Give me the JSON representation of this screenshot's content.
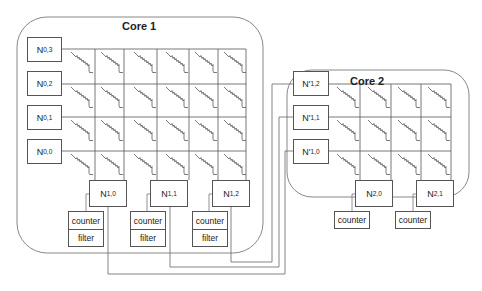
{
  "cores": [
    {
      "title": "Core 1",
      "row_nodes": [
        {
          "base": "N",
          "sub": "0,3"
        },
        {
          "base": "N",
          "sub": "0,2"
        },
        {
          "base": "N",
          "sub": "0,1"
        },
        {
          "base": "N",
          "sub": "0,0"
        }
      ],
      "column_nodes": [
        {
          "base": "N",
          "sub": "1,0",
          "modules": [
            "counter",
            "filter"
          ]
        },
        {
          "base": "N",
          "sub": "1,1",
          "modules": [
            "counter",
            "filter"
          ]
        },
        {
          "base": "N",
          "sub": "1,2",
          "modules": [
            "counter",
            "filter"
          ]
        }
      ],
      "grid": {
        "rows": 4,
        "cols": 6,
        "cell_element": "resistor-synapse"
      }
    },
    {
      "title": "Core 2",
      "row_nodes": [
        {
          "base": "N'",
          "sub": "1,2"
        },
        {
          "base": "N'",
          "sub": "1,1"
        },
        {
          "base": "N'",
          "sub": "1,0"
        }
      ],
      "column_nodes": [
        {
          "base": "N",
          "sub": "2,0",
          "modules": [
            "counter"
          ]
        },
        {
          "base": "N",
          "sub": "2,1",
          "modules": [
            "counter"
          ]
        }
      ],
      "grid": {
        "rows": 3,
        "cols": 4,
        "cell_element": "resistor-synapse"
      }
    }
  ],
  "connections": [
    {
      "from": "N1,0",
      "to": "N'1,0"
    },
    {
      "from": "N1,1",
      "to": "N'1,1"
    },
    {
      "from": "N1,2",
      "to": "N'1,2"
    }
  ],
  "colors": {
    "line": "#555555",
    "border": "#888888",
    "background": "#ffffff"
  }
}
